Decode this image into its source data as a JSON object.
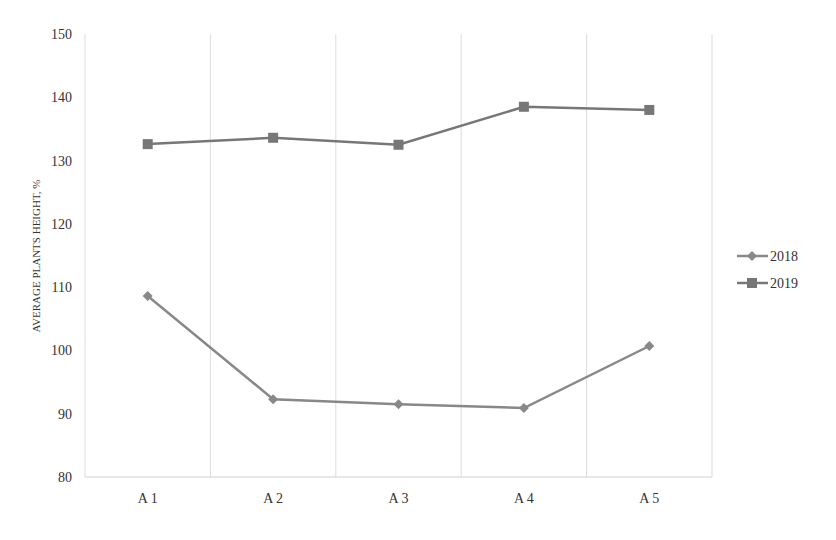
{
  "chart_data": {
    "type": "line",
    "title": "",
    "xlabel": "",
    "ylabel": "AVERAGE PLANTS HEIGHT, %",
    "categories": [
      "A1",
      "A2",
      "A3",
      "A4",
      "A5"
    ],
    "ylim": [
      80,
      150
    ],
    "yticks": [
      80,
      90,
      100,
      110,
      120,
      130,
      140,
      150
    ],
    "grid": {
      "vertical": true,
      "horizontal": false
    },
    "legend_position": "right",
    "series": [
      {
        "name": "2018",
        "marker": "diamond",
        "color": "#888888",
        "values": [
          108.6,
          92.3,
          91.5,
          90.9,
          100.7
        ]
      },
      {
        "name": "2019",
        "marker": "square",
        "color": "#777777",
        "values": [
          132.6,
          133.6,
          132.5,
          138.5,
          138.0
        ]
      }
    ]
  },
  "legend": {
    "items": [
      "2018",
      "2019"
    ]
  },
  "axis": {
    "ylabel": "AVERAGE PLANTS HEIGHT, %"
  }
}
